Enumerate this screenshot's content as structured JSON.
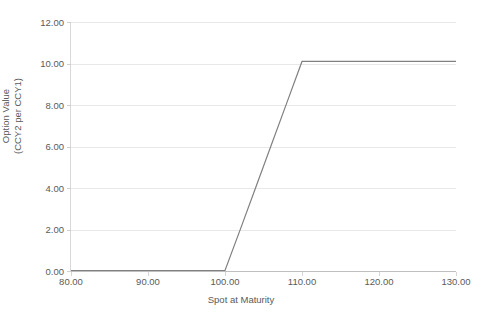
{
  "chart_data": {
    "type": "line",
    "title": "",
    "xlabel": "Spot at Maturity",
    "ylabel_line1": "Option Value",
    "ylabel_line2": "(CCY2 per CCY1)",
    "xlim": [
      80,
      130
    ],
    "ylim": [
      0,
      12
    ],
    "xticks": [
      80,
      90,
      100,
      110,
      120,
      130
    ],
    "yticks": [
      0,
      2,
      4,
      6,
      8,
      10,
      12
    ],
    "xtick_labels": [
      "80.00",
      "90.00",
      "100.00",
      "110.00",
      "120.00",
      "130.00"
    ],
    "ytick_labels": [
      "0.00",
      "2.00",
      "4.00",
      "6.00",
      "8.00",
      "10.00",
      "12.00"
    ],
    "grid": {
      "horizontal": true,
      "vertical": false,
      "color": "#e8e8e8"
    },
    "legend": {
      "visible": false,
      "position": "none"
    },
    "series": [
      {
        "name": "Option Value",
        "color": "#808080",
        "width": 1.2,
        "x": [
          80,
          85,
          90,
          95,
          100,
          102,
          104,
          106,
          108,
          110,
          115,
          120,
          125,
          130
        ],
        "values": [
          0,
          0,
          0,
          0,
          0,
          2.02,
          4.04,
          6.06,
          8.08,
          10.1,
          10.1,
          10.1,
          10.1,
          10.1
        ]
      }
    ],
    "annotations": [],
    "description_points": {
      "flat_low_start": {
        "x": 80,
        "y": 0
      },
      "kink_lower": {
        "x": 100,
        "y": 0
      },
      "kink_upper": {
        "x": 110,
        "y": 10.1
      },
      "flat_high_end": {
        "x": 130,
        "y": 10.1
      }
    }
  },
  "axis_colors": {
    "axis_line": "#bfbfbf",
    "gridline": "#e8e8e8",
    "tick_text": "#5a5a5a",
    "series_line": "#808080"
  },
  "caption": {
    "bottom_fragment": ""
  }
}
